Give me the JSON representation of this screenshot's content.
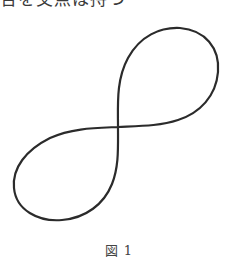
{
  "text_above": "合を交点は持つ",
  "figure": {
    "stroke_color": "#2b2b2b",
    "crossing_point": [
      118,
      127
    ]
  },
  "caption": {
    "label": "図",
    "number": "1"
  }
}
